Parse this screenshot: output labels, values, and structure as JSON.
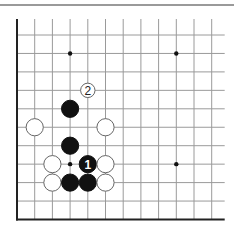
{
  "diagram": {
    "type": "go-board-corner",
    "top_rule_color": "#9a9a9a",
    "line_color": "#9a9a9a",
    "edge_color": "#222222",
    "grid": {
      "columns": 12,
      "rows": 11,
      "origin_x": 17,
      "origin_y": 35,
      "spacing_x": 17.7,
      "spacing_y": 18.45,
      "line_extend_right": 13,
      "left_edge_top": 19,
      "edges": [
        "left",
        "bottom"
      ]
    },
    "star_points": [
      {
        "col": 3,
        "row": 1
      },
      {
        "col": 9,
        "row": 1
      },
      {
        "col": 3,
        "row": 7
      },
      {
        "col": 9,
        "row": 7
      }
    ],
    "stones": [
      {
        "color": "white",
        "col": 4,
        "row": 3,
        "label": "2",
        "size": "small"
      },
      {
        "color": "black",
        "col": 3,
        "row": 4,
        "label": ""
      },
      {
        "color": "white",
        "col": 1,
        "row": 5,
        "label": ""
      },
      {
        "color": "white",
        "col": 5,
        "row": 5,
        "label": ""
      },
      {
        "color": "black",
        "col": 3,
        "row": 6,
        "label": ""
      },
      {
        "color": "white",
        "col": 2,
        "row": 7,
        "label": ""
      },
      {
        "color": "black",
        "col": 4,
        "row": 7,
        "label": "1"
      },
      {
        "color": "white",
        "col": 5,
        "row": 7,
        "label": ""
      },
      {
        "color": "white",
        "col": 2,
        "row": 8,
        "label": ""
      },
      {
        "color": "black",
        "col": 3,
        "row": 8,
        "label": ""
      },
      {
        "color": "black",
        "col": 4,
        "row": 8,
        "label": ""
      },
      {
        "color": "white",
        "col": 5,
        "row": 8,
        "label": ""
      }
    ],
    "move_labels": [
      "1",
      "2"
    ]
  }
}
